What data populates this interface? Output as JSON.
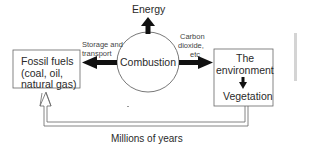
{
  "diagram": {
    "nodes": {
      "fossil_fuels": {
        "lines": [
          "Fossil fuels",
          "(coal, oil,",
          "natural gas)"
        ]
      },
      "combustion": {
        "label": "Combustion"
      },
      "energy": {
        "label": "Energy"
      },
      "environment": {
        "title_line1": "The",
        "title_line2": "environment",
        "sub": "Vegetation"
      }
    },
    "edges": {
      "storage": {
        "line1": "Storage and",
        "line2": "transport"
      },
      "carbon": {
        "line1": "Carbon",
        "line2": "dioxide,",
        "line3": "etc"
      },
      "millions": {
        "label": "Millions of years"
      }
    }
  }
}
